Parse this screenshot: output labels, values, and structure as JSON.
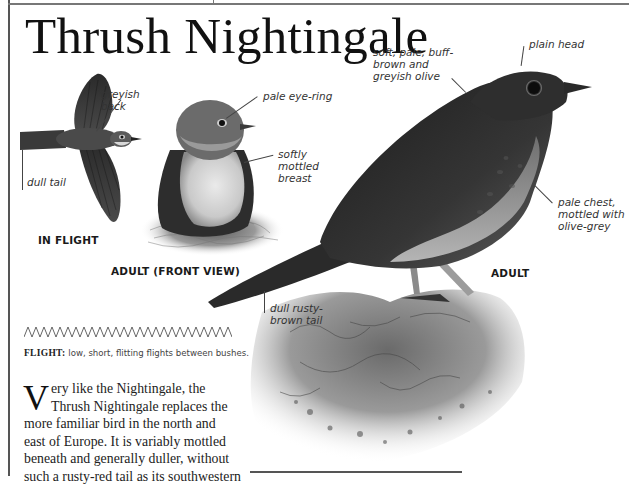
{
  "page": {
    "title": "Thrush Nightingale"
  },
  "illustrations": {
    "flight": {
      "caption": "IN FLIGHT",
      "labels": {
        "back": "greyish\nback",
        "tail": "dull tail"
      }
    },
    "front_view": {
      "caption": "ADULT (FRONT VIEW)",
      "labels": {
        "eye_ring": "pale eye-ring",
        "breast": "softly\nmottled\nbreast"
      }
    },
    "adult": {
      "caption": "ADULT",
      "labels": {
        "plumage": "soft, pale, buff-\nbrown and\ngreyish olive",
        "head": "plain head",
        "chest": "pale chest,\nmottled with\nolive-grey",
        "tail": "dull rusty-\nbrown tail"
      }
    }
  },
  "flight_pattern": {
    "icon": "zigzag-flight-icon",
    "label": "FLIGHT:",
    "description": "low, short, flitting flights between bushes."
  },
  "body": {
    "dropcap": "V",
    "lines": [
      "ery like the Nightingale, the",
      "Thrush Nightingale replaces the",
      "more familiar bird in the north and",
      "east of Europe. It is variably mottled",
      "beneath and generally duller, without",
      "such a rusty-red tail as its southwestern"
    ]
  },
  "colors": {
    "text": "#1a1a1a",
    "label": "#333333",
    "rule": "#555555",
    "background": "#ffffff"
  }
}
